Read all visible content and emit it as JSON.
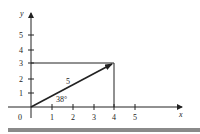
{
  "diagram": {
    "type": "vector-components",
    "axes": {
      "x_label": "x",
      "y_label": "y",
      "origin_label": "0",
      "x_ticks": [
        "1",
        "2",
        "3",
        "4",
        "5"
      ],
      "y_ticks": [
        "1",
        "2",
        "3",
        "4",
        "5"
      ]
    },
    "vector": {
      "from": [
        0,
        0
      ],
      "to": [
        4,
        3
      ],
      "magnitude_label": "5",
      "angle_label": "38°"
    },
    "projection_lines": {
      "horizontal_to_y": 3,
      "vertical_to_x": 4
    },
    "colors": {
      "lines": "#222222",
      "footer_bar": "#8a8a8a",
      "background": "#ffffff"
    }
  }
}
